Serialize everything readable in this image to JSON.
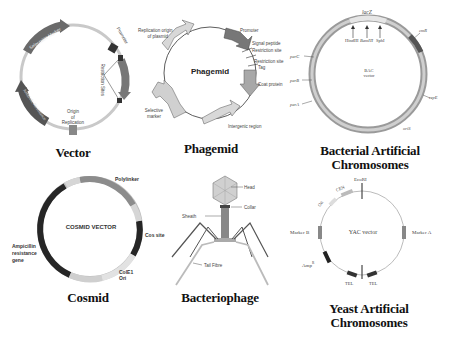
{
  "figure": {
    "panels": [
      {
        "id": "vector",
        "caption": "Vector",
        "labels": {
          "selectable_marker": "Selectable Marker",
          "promoter": "Promoter",
          "restriction_sites": "Restriction Sites",
          "origin_line1": "Origin",
          "origin_line2": "of",
          "origin_line3": "Replication",
          "gene": "Antibiotic Resistance"
        }
      },
      {
        "id": "phagemid",
        "caption": "Phagemid",
        "center_label": "Phagemid",
        "labels": {
          "replication_origin_line1": "Replication origin",
          "replication_origin_line2": "of plasmid",
          "promoter": "Promoter",
          "signal_peptide": "Signal peptide",
          "restriction_site_1": "Restriction site",
          "restriction_site_2": "Restriction site",
          "tag": "Tag",
          "coat_protein": "Coat protein",
          "intergenic_region": "Intergenic region",
          "selective_marker_line1": "Selective",
          "selective_marker_line2": "marker"
        }
      },
      {
        "id": "bac",
        "caption_line1": "Bacterial Artificial",
        "caption_line2": "Chromosomes",
        "center_line1": "BAC",
        "center_line2": "vector",
        "labels": {
          "lacZ": "lacZ",
          "hindIII": "HindIII",
          "bamHI": "BamHI",
          "sphI": "SphI",
          "cmR": "cmR",
          "parC": "parC",
          "parB": "parB",
          "parA": "parA",
          "repE": "repE",
          "oriS": "oriS"
        }
      },
      {
        "id": "cosmid",
        "caption": "Cosmid",
        "center_label": "COSMID VECTOR",
        "labels": {
          "polylinker": "Polylinker",
          "cos_site": "Cos site",
          "cole1_line1": "ColE1",
          "cole1_line2": "Ori",
          "amp_line1": "Ampicillin",
          "amp_line2": "resistance",
          "amp_line3": "gene"
        }
      },
      {
        "id": "bacteriophage",
        "caption": "Bacteriophage",
        "labels": {
          "head": "Head",
          "collar": "Collar",
          "sheath": "Sheath",
          "tail_fibre": "Tail Fibre"
        }
      },
      {
        "id": "yac",
        "caption_line1": "Yeast Artificial",
        "caption_line2": "Chromosomes",
        "center_label": "YAC vector",
        "labels": {
          "ecori": "EcoRI",
          "cen": "CEN",
          "ori": "Ori",
          "marker_b": "Marker B",
          "marker_a": "Marker A",
          "amp": "Amp",
          "amp_sup": "R",
          "tel_left": "TEL",
          "tel_right": "TEL"
        }
      }
    ],
    "colors": {
      "ring_light": "#c8c8c8",
      "arrow_dark": "#5a5a5a",
      "arrow_light": "#d2d2d2",
      "cosmid_dark": "#2a2a2a",
      "cosmid_mid": "#8a8a8a",
      "text": "#111111"
    }
  }
}
